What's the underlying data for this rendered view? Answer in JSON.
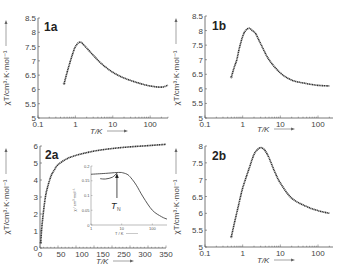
{
  "chart_data": [
    {
      "id": "1a",
      "type": "scatter",
      "panel_label": "1a",
      "xlabel": "T/K",
      "ylabel": "χT/cm³·K·mol⁻¹",
      "xscale": "log",
      "xlim": [
        0.1,
        300
      ],
      "ylim": [
        5,
        8.5
      ],
      "xticks": [
        "0.1",
        "1",
        "10",
        "100"
      ],
      "yticks": [
        "5",
        "5.5",
        "6",
        "6.5",
        "7",
        "7.5",
        "8",
        "8.5"
      ],
      "grid": false,
      "series": [
        {
          "name": "experimental",
          "x": [
            0.5,
            0.6,
            0.7,
            0.8,
            0.9,
            1.0,
            1.2,
            1.4,
            1.7,
            2,
            3,
            5,
            10,
            20,
            50,
            100,
            200,
            300
          ],
          "y": [
            6.2,
            6.6,
            6.9,
            7.15,
            7.35,
            7.5,
            7.63,
            7.65,
            7.55,
            7.45,
            7.2,
            6.9,
            6.6,
            6.4,
            6.22,
            6.12,
            6.08,
            6.15
          ]
        }
      ]
    },
    {
      "id": "1b",
      "type": "scatter",
      "panel_label": "1b",
      "xlabel": "T/K",
      "ylabel": "χT/cm³·K·mol⁻¹",
      "xscale": "log",
      "xlim": [
        0.1,
        250
      ],
      "ylim": [
        5,
        8.5
      ],
      "xticks": [
        "0.1",
        "1",
        "10",
        "100"
      ],
      "yticks": [
        "5",
        "5.5",
        "6",
        "6.5",
        "7",
        "7.5",
        "8",
        "8.5"
      ],
      "grid": false,
      "series": [
        {
          "name": "experimental",
          "x": [
            0.5,
            0.6,
            0.7,
            0.8,
            1.0,
            1.2,
            1.5,
            1.8,
            2.2,
            3,
            5,
            10,
            20,
            50,
            100,
            200
          ],
          "y": [
            6.4,
            6.75,
            7.0,
            7.35,
            7.8,
            8.0,
            8.08,
            8.0,
            7.9,
            7.55,
            7.0,
            6.55,
            6.3,
            6.18,
            6.12,
            6.1
          ]
        }
      ]
    },
    {
      "id": "2a",
      "type": "scatter",
      "panel_label": "2a",
      "xlabel": "T/K",
      "ylabel": "χT/cm³·K·mol⁻¹",
      "xscale": "linear",
      "xlim": [
        0,
        350
      ],
      "ylim": [
        0,
        6
      ],
      "xticks": [
        "0",
        "50",
        "100",
        "150",
        "250",
        "300",
        "350"
      ],
      "yticks": [
        "0",
        "1",
        "2",
        "3",
        "4",
        "5",
        "6"
      ],
      "grid": false,
      "series": [
        {
          "name": "experimental",
          "x": [
            2,
            5,
            10,
            15,
            20,
            30,
            40,
            50,
            75,
            100,
            150,
            200,
            250,
            300,
            350
          ],
          "y": [
            0.3,
            1.2,
            2.2,
            3.0,
            3.5,
            4.2,
            4.6,
            4.9,
            5.25,
            5.45,
            5.7,
            5.85,
            5.95,
            6.02,
            6.1
          ]
        }
      ],
      "inset": {
        "type": "line",
        "xlabel": "T / K",
        "ylabel": "χ / cm³·mol⁻¹",
        "xscale": "log",
        "xlim": [
          1,
          300
        ],
        "ylim": [
          0,
          0.2
        ],
        "xticks": [
          "1",
          "10",
          "100"
        ],
        "yticks": [
          "0",
          "0.05",
          "0.1",
          "0.15",
          "0.2"
        ],
        "annotation": "T_N",
        "annotation_x": 7,
        "series": [
          {
            "name": "chi_parallel_upper",
            "x": [
              1,
              3,
              7,
              10
            ],
            "y": [
              0.172,
              0.175,
              0.178,
              0.178
            ]
          },
          {
            "name": "chi_lower_branch",
            "x": [
              2,
              3,
              5,
              7
            ],
            "y": [
              0.157,
              0.156,
              0.162,
              0.176
            ]
          },
          {
            "name": "chi_main",
            "x": [
              10,
              15,
              20,
              30,
              50,
              100,
              200,
              300
            ],
            "y": [
              0.178,
              0.172,
              0.16,
              0.135,
              0.095,
              0.05,
              0.028,
              0.02
            ]
          }
        ]
      }
    },
    {
      "id": "2b",
      "type": "scatter",
      "panel_label": "2b",
      "xlabel": "T/K",
      "ylabel": "χT/cm³·K·mol⁻¹",
      "xscale": "log",
      "xlim": [
        0.1,
        250
      ],
      "ylim": [
        5,
        8
      ],
      "xticks": [
        "0.1",
        "1",
        "10",
        "100"
      ],
      "yticks": [
        "5",
        "5.5",
        "6",
        "6.5",
        "7",
        "7.5",
        "8"
      ],
      "grid": false,
      "series": [
        {
          "name": "experimental",
          "x": [
            0.5,
            0.6,
            0.8,
            1.0,
            1.5,
            2,
            2.5,
            3,
            3.5,
            4,
            5,
            7,
            10,
            20,
            50,
            100,
            200
          ],
          "y": [
            5.3,
            5.7,
            6.3,
            6.75,
            7.35,
            7.75,
            7.9,
            7.95,
            7.92,
            7.85,
            7.65,
            7.25,
            6.9,
            6.45,
            6.2,
            6.08,
            6.0
          ]
        }
      ]
    }
  ],
  "panels": {
    "p1a": {
      "label": "1a",
      "xlabel": "T/K",
      "ylabel": "χT/cm³·K·mol⁻¹"
    },
    "p1b": {
      "label": "1b",
      "xlabel": "T/K",
      "ylabel": "χT/cm³·K·mol⁻¹"
    },
    "p2a": {
      "label": "2a",
      "xlabel": "T/K",
      "ylabel": "χT/cm³·K·mol⁻¹",
      "inset_xlabel": "T / K",
      "inset_ylabel": "χ / cm³·mol⁻¹",
      "inset_annotation": "T",
      "inset_annotation_sub": "N"
    },
    "p2b": {
      "label": "2b",
      "xlabel": "T/K",
      "ylabel": "χT/cm³·K·mol⁻¹"
    }
  },
  "colors": {
    "data": "#333333",
    "axis": "#555555",
    "text": "#444444"
  }
}
